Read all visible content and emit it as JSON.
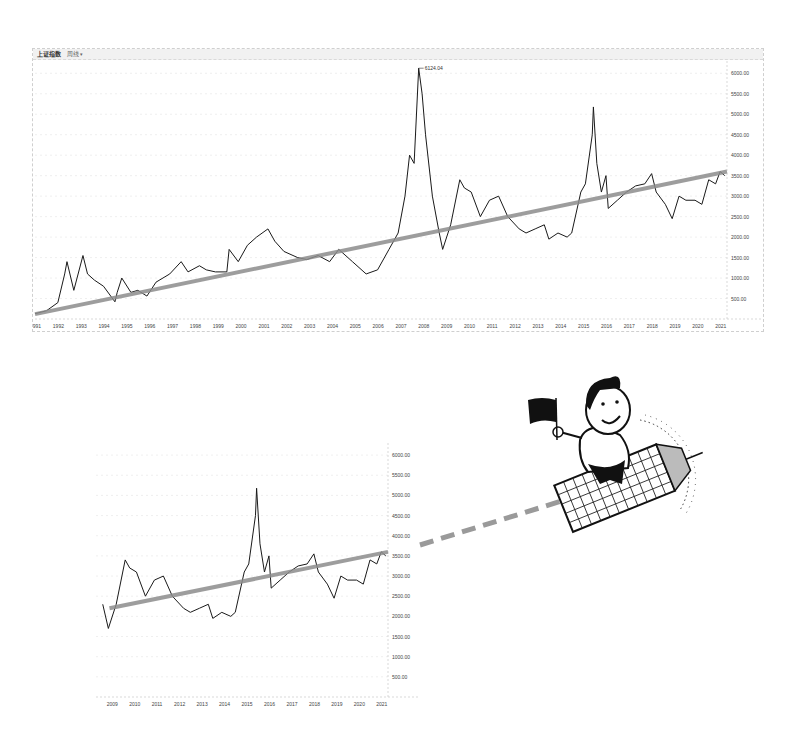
{
  "top_chart": {
    "header": {
      "title": "上证指数",
      "period": "周线",
      "dropdown_icon": "chevron-down-icon"
    },
    "peak_label": "6124.04"
  },
  "bottom_chart": {},
  "colors": {
    "line": "#1a1a1a",
    "trend": "#8c8c8c",
    "grid": "#e4e4e4",
    "axis_text": "#444444",
    "dash": "#9a9a9a"
  },
  "chart_data": [
    {
      "type": "line",
      "title": "上证指数 周线 (Shanghai Composite Index, weekly) 1991–2021 with long-term trend line",
      "xlabel": "",
      "ylabel": "",
      "x_ticks": [
        "1991",
        "1992",
        "1993",
        "1994",
        "1995",
        "1996",
        "1997",
        "1998",
        "1999",
        "2000",
        "2001",
        "2002",
        "2003",
        "2004",
        "2005",
        "2006",
        "2007",
        "2008",
        "2009",
        "2010",
        "2011",
        "2012",
        "2013",
        "2014",
        "2015",
        "2016",
        "2017",
        "2018",
        "2019",
        "2020",
        "2021"
      ],
      "y_ticks": [
        500,
        1000,
        1500,
        2000,
        2500,
        3000,
        3500,
        4000,
        4500,
        5000,
        5500,
        6000
      ],
      "ylim": [
        0,
        6300
      ],
      "xlim": [
        1991,
        2021.3
      ],
      "grid": true,
      "annotations": [
        {
          "x": 2007.8,
          "y": 6124.04,
          "text": "6124.04"
        }
      ],
      "series": [
        {
          "name": "上证指数",
          "x": [
            1991,
            1991.5,
            1992,
            1992.3,
            1992.4,
            1992.7,
            1993.1,
            1993.3,
            1993.6,
            1994.0,
            1994.5,
            1994.6,
            1994.8,
            1995.2,
            1995.5,
            1995.9,
            1996.3,
            1996.9,
            1997.4,
            1997.7,
            1998.2,
            1998.5,
            1998.9,
            1999.4,
            1999.5,
            1999.9,
            2000.3,
            2000.7,
            2001.2,
            2001.5,
            2001.9,
            2002.5,
            2002.9,
            2003.4,
            2003.9,
            2004.3,
            2004.9,
            2005.5,
            2006.0,
            2006.5,
            2006.9,
            2007.2,
            2007.4,
            2007.6,
            2007.8,
            2007.95,
            2008.1,
            2008.4,
            2008.7,
            2008.85,
            2009.2,
            2009.6,
            2009.8,
            2010.1,
            2010.5,
            2010.9,
            2011.3,
            2011.7,
            2012.2,
            2012.5,
            2012.9,
            2013.3,
            2013.5,
            2013.9,
            2014.3,
            2014.5,
            2014.9,
            2015.1,
            2015.4,
            2015.45,
            2015.6,
            2015.8,
            2016.0,
            2016.1,
            2016.5,
            2016.9,
            2017.3,
            2017.7,
            2018.0,
            2018.2,
            2018.6,
            2018.9,
            2019.2,
            2019.5,
            2019.9,
            2020.2,
            2020.5,
            2020.8,
            2021.0,
            2021.2
          ],
          "values": [
            130,
            200,
            400,
            1100,
            1400,
            700,
            1550,
            1100,
            950,
            800,
            420,
            650,
            1000,
            650,
            700,
            560,
            900,
            1100,
            1400,
            1150,
            1300,
            1200,
            1150,
            1150,
            1700,
            1400,
            1800,
            2000,
            2200,
            1900,
            1650,
            1500,
            1450,
            1550,
            1400,
            1700,
            1400,
            1100,
            1200,
            1700,
            2100,
            3000,
            4000,
            3800,
            6124,
            5500,
            4500,
            3000,
            2100,
            1700,
            2300,
            3400,
            3200,
            3100,
            2500,
            2900,
            3000,
            2500,
            2200,
            2100,
            2200,
            2300,
            1950,
            2100,
            2000,
            2100,
            3100,
            3300,
            4500,
            5178,
            3800,
            3100,
            3500,
            2700,
            2900,
            3100,
            3250,
            3300,
            3550,
            3100,
            2800,
            2450,
            3000,
            2900,
            2900,
            2800,
            3400,
            3300,
            3600,
            3500
          ]
        },
        {
          "name": "trend",
          "x": [
            1991,
            2021.3
          ],
          "values": [
            120,
            3600
          ]
        }
      ]
    },
    {
      "type": "line",
      "title": "上证指数 2009–2021 (zoomed) with trend line extension",
      "x_ticks": [
        "2009",
        "2010",
        "2011",
        "2012",
        "2013",
        "2014",
        "2015",
        "2016",
        "2017",
        "2018",
        "2019",
        "2020",
        "2021"
      ],
      "y_ticks": [
        500,
        1000,
        1500,
        2000,
        2500,
        3000,
        3500,
        4000,
        4500,
        5000,
        5500,
        6000
      ],
      "ylim": [
        0,
        6300
      ],
      "xlim": [
        2008.3,
        2021.3
      ],
      "grid": true,
      "series": [
        {
          "name": "上证指数",
          "x": [
            2008.6,
            2008.85,
            2009.2,
            2009.6,
            2009.8,
            2010.1,
            2010.5,
            2010.9,
            2011.3,
            2011.7,
            2012.2,
            2012.5,
            2012.9,
            2013.3,
            2013.5,
            2013.9,
            2014.3,
            2014.5,
            2014.9,
            2015.1,
            2015.4,
            2015.45,
            2015.6,
            2015.8,
            2016.0,
            2016.1,
            2016.5,
            2016.9,
            2017.3,
            2017.7,
            2018.0,
            2018.2,
            2018.6,
            2018.9,
            2019.2,
            2019.5,
            2019.9,
            2020.2,
            2020.5,
            2020.8,
            2021.0,
            2021.2
          ],
          "values": [
            2300,
            1700,
            2300,
            3400,
            3200,
            3100,
            2500,
            2900,
            3000,
            2500,
            2200,
            2100,
            2200,
            2300,
            1950,
            2100,
            2000,
            2100,
            3100,
            3300,
            4500,
            5178,
            3800,
            3100,
            3500,
            2700,
            2900,
            3100,
            3250,
            3300,
            3550,
            3100,
            2800,
            2450,
            3000,
            2900,
            2900,
            2800,
            3400,
            3300,
            3600,
            3500
          ]
        },
        {
          "name": "trend",
          "x": [
            2008.9,
            2021.3
          ],
          "values": [
            2200,
            3600
          ]
        }
      ]
    }
  ]
}
